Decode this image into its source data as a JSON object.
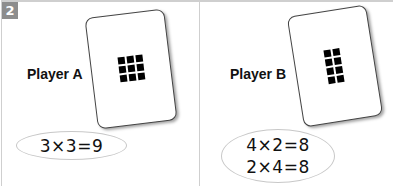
{
  "badge": {
    "label": "2",
    "color": "#8d8d8d"
  },
  "panels": [
    {
      "player": "Player A",
      "card": {
        "rows": 3,
        "cols": 3,
        "dots": 9
      },
      "equations": [
        "3×3=9"
      ]
    },
    {
      "player": "Player B",
      "card": {
        "rows": 4,
        "cols": 2,
        "dots": 8
      },
      "equations": [
        "4×2=8",
        "2×4=8"
      ]
    }
  ]
}
